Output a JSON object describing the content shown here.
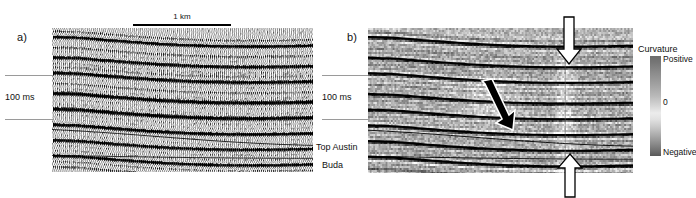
{
  "figure": {
    "caption_hidden": "",
    "panels": [
      {
        "id": "a",
        "label": "a)",
        "type": "seismic-wiggle-section",
        "display": "wiggle-trace-variable-area",
        "colors": {
          "trace": "#000000",
          "background": "#ffffff"
        }
      },
      {
        "id": "b",
        "label": "b)",
        "type": "seismic-section-with-curvature-overlay",
        "display": "variable-density-grayscale",
        "colors": {
          "trace": "#000000",
          "background": "#b4b4b4"
        }
      }
    ]
  },
  "scalebar": {
    "label": "1 km",
    "length_px": 98
  },
  "time_axis": {
    "interval_label": "100 ms",
    "tick_count": 2
  },
  "horizons": [
    {
      "name": "Top Austin"
    },
    {
      "name": "Buda"
    }
  ],
  "colorbar": {
    "title": "Curvature",
    "max_label": "Positive",
    "mid_label": "0",
    "min_label": "Negative",
    "colors": {
      "positive": "#6d6d6d",
      "zero": "#ececec",
      "negative": "#595959"
    }
  },
  "annotations": [
    {
      "name": "white-arrow-top",
      "shape": "down-arrow",
      "fill": "#ffffff",
      "stroke": "#000000"
    },
    {
      "name": "white-arrow-bottom",
      "shape": "up-arrow",
      "fill": "#ffffff",
      "stroke": "#000000"
    },
    {
      "name": "black-arrow-middle",
      "shape": "diagonal-arrow",
      "fill": "#000000",
      "stroke": "#ffffff"
    }
  ]
}
